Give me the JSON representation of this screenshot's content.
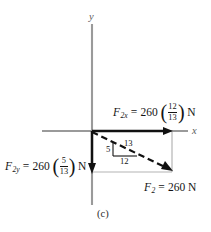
{
  "figure": {
    "caption": "(c)",
    "axes": {
      "y_label": "y",
      "x_label": "x"
    },
    "vectors": {
      "x_component": {
        "symbol": "F",
        "subscript": "2x",
        "equals": "=",
        "magnitude": "260",
        "fraction_numerator": "12",
        "fraction_denominator": "13",
        "unit": "N",
        "full_text": "F2x = 260 (12/13) N",
        "style": "solid",
        "direction": "right"
      },
      "y_component": {
        "symbol": "F",
        "subscript": "2y",
        "equals": "=",
        "magnitude": "260",
        "fraction_numerator": "5",
        "fraction_denominator": "13",
        "unit": "N",
        "full_text": "F2y = 260 (5/13) N",
        "style": "solid",
        "direction": "down"
      },
      "resultant": {
        "symbol": "F",
        "subscript": "2",
        "equals": "=",
        "magnitude": "260",
        "unit": "N",
        "full_text": "F2 = 260 N",
        "style": "dashed",
        "direction": "down-right"
      }
    },
    "slope_triangle": {
      "hypotenuse": "13",
      "vertical": "5",
      "horizontal": "12"
    },
    "colors": {
      "axis": "#9a9a9a",
      "vector": "#111111",
      "guide": "#b4b4b4",
      "text": "#141414"
    }
  }
}
